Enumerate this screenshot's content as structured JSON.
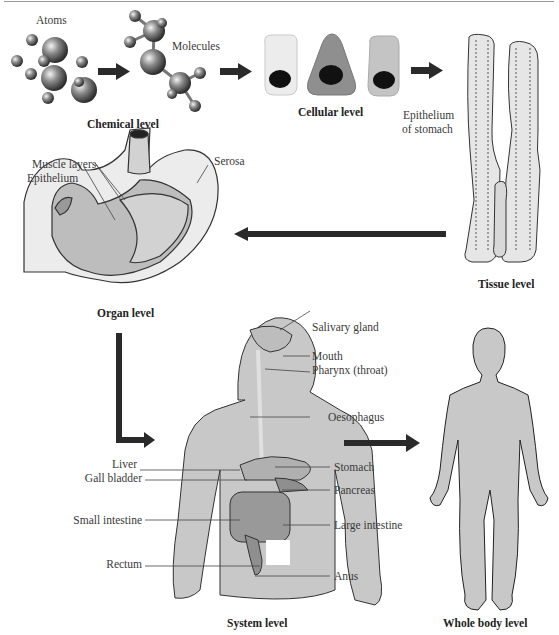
{
  "diagram": {
    "flow": [
      "Chemical level",
      "Cellular level",
      "Tissue level",
      "Organ level",
      "System level",
      "Whole body level"
    ],
    "levels": {
      "chemical": {
        "label": "Chemical level",
        "parts": {
          "atoms": "Atoms",
          "molecules": "Molecules"
        }
      },
      "cellular": {
        "label": "Cellular level"
      },
      "tissue": {
        "label": "Tissue level",
        "caption_line1": "Epithelium",
        "caption_line2": "of stomach"
      },
      "organ": {
        "label": "Organ level",
        "parts": {
          "muscle_layers": "Muscle layers",
          "epithelium": "Epithelium",
          "serosa": "Serosa"
        }
      },
      "system": {
        "label": "System level",
        "parts_right": [
          "Salivary gland",
          "Mouth",
          "Pharynx (throat)",
          "Oesophagus",
          "Stomach",
          "Pancreas",
          "Large intestine",
          "Anus"
        ],
        "parts_left": [
          "Liver",
          "Gall bladder",
          "Small intestine",
          "Rectum"
        ]
      },
      "whole_body": {
        "label": "Whole body level"
      }
    },
    "colors": {
      "body_fill": "#c8c8c8",
      "cell_light": "#ececec",
      "cell_mid": "#8f8f8f",
      "cell_grey": "#c4c4c4",
      "arrow": "#2a2a2a",
      "outline": "#222222"
    }
  }
}
